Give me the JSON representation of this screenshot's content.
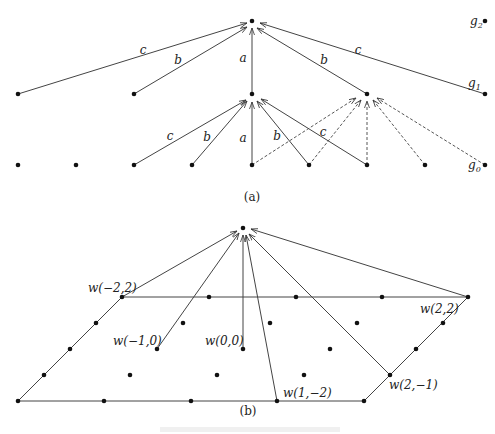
{
  "figure": {
    "panel_a": {
      "caption": "(a)",
      "level_labels": [
        "g2",
        "g1",
        "g0"
      ],
      "nodes": {
        "top": [
          252,
          21
        ],
        "g2_marker": [
          485,
          21
        ],
        "row1": [
          [
            18,
            94
          ],
          [
            134,
            94
          ],
          [
            252,
            94
          ],
          [
            367,
            94
          ],
          [
            485,
            94
          ]
        ],
        "row0": [
          [
            18,
            165
          ],
          [
            76,
            165
          ],
          [
            134,
            165
          ],
          [
            192,
            165
          ],
          [
            252,
            165
          ],
          [
            309,
            165
          ],
          [
            367,
            165
          ],
          [
            425,
            165
          ],
          [
            485,
            165
          ]
        ]
      },
      "solid_edges": [
        {
          "from": [
            18,
            94
          ],
          "to": [
            247,
            23
          ],
          "label": "c",
          "lx": 143,
          "ly": 54
        },
        {
          "from": [
            134,
            94
          ],
          "to": [
            247,
            27
          ],
          "label": "b",
          "lx": 178,
          "ly": 64
        },
        {
          "from": [
            252,
            94
          ],
          "to": [
            252,
            28
          ],
          "label": "a",
          "lx": 243,
          "ly": 62
        },
        {
          "from": [
            367,
            94
          ],
          "to": [
            257,
            28
          ],
          "label": "b",
          "lx": 324,
          "ly": 64
        },
        {
          "from": [
            485,
            94
          ],
          "to": [
            260,
            23
          ],
          "label": "c",
          "lx": 358,
          "ly": 54
        },
        {
          "from": [
            134,
            165
          ],
          "to": [
            246,
            100
          ],
          "label": "c",
          "lx": 170,
          "ly": 140
        },
        {
          "from": [
            192,
            165
          ],
          "to": [
            247,
            101
          ],
          "label": "b",
          "lx": 207,
          "ly": 141
        },
        {
          "from": [
            252,
            165
          ],
          "to": [
            252,
            102
          ],
          "label": "a",
          "lx": 243,
          "ly": 142
        },
        {
          "from": [
            309,
            165
          ],
          "to": [
            257,
            101
          ],
          "label": "b",
          "lx": 277,
          "ly": 140
        },
        {
          "from": [
            367,
            165
          ],
          "to": [
            261,
            99
          ],
          "label": "c",
          "lx": 323,
          "ly": 136
        }
      ],
      "dashed_edges": [
        {
          "from": [
            252,
            165
          ],
          "to": [
            356,
            98
          ]
        },
        {
          "from": [
            309,
            165
          ],
          "to": [
            361,
            100
          ]
        },
        {
          "from": [
            367,
            165
          ],
          "to": [
            367,
            101
          ]
        },
        {
          "from": [
            425,
            165
          ],
          "to": [
            373,
            100
          ]
        },
        {
          "from": [
            485,
            165
          ],
          "to": [
            377,
            98
          ]
        }
      ]
    },
    "panel_b": {
      "caption": "(b)",
      "apex": [
        243,
        228
      ],
      "parallelogram": [
        [
          122,
          297
        ],
        [
          468,
          297
        ],
        [
          364,
          401
        ],
        [
          18,
          401
        ]
      ],
      "lattice_points": [
        [
          122,
          297
        ],
        [
          209,
          297
        ],
        [
          296,
          297
        ],
        [
          382,
          297
        ],
        [
          468,
          297
        ],
        [
          96,
          323
        ],
        [
          183,
          323
        ],
        [
          270,
          323
        ],
        [
          357,
          323
        ],
        [
          443,
          323
        ],
        [
          70,
          349
        ],
        [
          157,
          349
        ],
        [
          243,
          349
        ],
        [
          330,
          349
        ],
        [
          416,
          349
        ],
        [
          44,
          375
        ],
        [
          130,
          375
        ],
        [
          217,
          375
        ],
        [
          304,
          375
        ],
        [
          390,
          375
        ],
        [
          18,
          401
        ],
        [
          104,
          401
        ],
        [
          191,
          401
        ],
        [
          277,
          401
        ],
        [
          364,
          401
        ]
      ],
      "arrows": [
        {
          "from": [
            122,
            297
          ],
          "to": [
            237,
            231
          ]
        },
        {
          "from": [
            157,
            349
          ],
          "to": [
            239,
            233
          ]
        },
        {
          "from": [
            243,
            349
          ],
          "to": [
            243,
            235
          ]
        },
        {
          "from": [
            277,
            401
          ],
          "to": [
            246,
            235
          ]
        },
        {
          "from": [
            390,
            375
          ],
          "to": [
            249,
            234
          ]
        },
        {
          "from": [
            468,
            297
          ],
          "to": [
            251,
            229
          ]
        }
      ],
      "labels": [
        {
          "text": "w(−2,2)",
          "x": 88,
          "y": 292
        },
        {
          "text": "w(−1,0)",
          "x": 113,
          "y": 345
        },
        {
          "text": "w(0,0)",
          "x": 205,
          "y": 345
        },
        {
          "text": "w(1,−2)",
          "x": 283,
          "y": 397
        },
        {
          "text": "w(2,−1)",
          "x": 389,
          "y": 389
        },
        {
          "text": "w(2,2)",
          "x": 420,
          "y": 313
        }
      ]
    },
    "bottom_caption_faint": "Figure caption (illegible)"
  }
}
